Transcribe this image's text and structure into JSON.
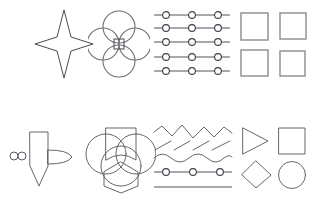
{
  "canvas": {
    "width": 315,
    "height": 200,
    "background": "#ffffff",
    "title": "Shape Sketch Canvas",
    "stroke_colors": {
      "dark": "#4a4a52",
      "mid": "#6e6e76",
      "gray": "#8a8a92",
      "thin": "#55555d",
      "node_fill": "#ffffff"
    }
  },
  "rows": [
    {
      "id": "row-top",
      "label": "Top row",
      "cells": [
        {
          "id": "four-point-star",
          "icon_name": "four-point-star-icon",
          "label": "Four point star",
          "x": 33,
          "y": 8,
          "width": 62,
          "height": 72
        },
        {
          "id": "circle-quatrefoil",
          "icon_name": "quatrefoil-circles-icon",
          "label": "Four overlapping circles with center square",
          "x": 88,
          "y": 10,
          "width": 62,
          "height": 68,
          "circle_count": 4,
          "has_center_square": true
        },
        {
          "id": "node-rails",
          "icon_name": "node-rail-lines-icon",
          "label": "Five node rails",
          "x": 152,
          "y": 10,
          "width": 80,
          "height": 66,
          "line_count": 5,
          "nodes_per_line": 3
        },
        {
          "id": "square-grid",
          "icon_name": "square-grid-icon",
          "label": "Two by two square grid",
          "x": 238,
          "y": 10,
          "width": 72,
          "height": 68,
          "rows": 2,
          "columns": 2
        }
      ]
    },
    {
      "id": "row-bottom",
      "label": "Bottom row",
      "cells": [
        {
          "id": "pencil-pin",
          "icon_name": "pencil-pin-icon",
          "label": "Vertical pencil with side leaf and beads",
          "x": 8,
          "y": 124,
          "width": 70,
          "height": 66,
          "bead_count": 2,
          "has_leaf": true
        },
        {
          "id": "circles-hex-bowtie",
          "icon_name": "circles-hexagon-bowtie-icon",
          "label": "Three circles with bowtie and hexagon",
          "x": 84,
          "y": 122,
          "width": 72,
          "height": 72,
          "circle_count": 3,
          "has_bowtie": true,
          "has_hexagon": true
        },
        {
          "id": "zigzag-stack",
          "icon_name": "zigzag-wave-stack-icon",
          "label": "Zigzag hatching waves and node rail",
          "x": 152,
          "y": 124,
          "width": 82,
          "height": 68,
          "zigzag_count": 1,
          "hatch_count": 4,
          "wave_count": 1,
          "rail_nodes": 3,
          "plain_line_count": 1
        },
        {
          "id": "primitive-shapes",
          "icon_name": "primitive-shapes-icon",
          "label": "Triangle square diamond circle",
          "x": 238,
          "y": 126,
          "width": 72,
          "height": 64,
          "shapes": [
            "triangle",
            "square",
            "diamond",
            "circle"
          ]
        }
      ]
    }
  ]
}
